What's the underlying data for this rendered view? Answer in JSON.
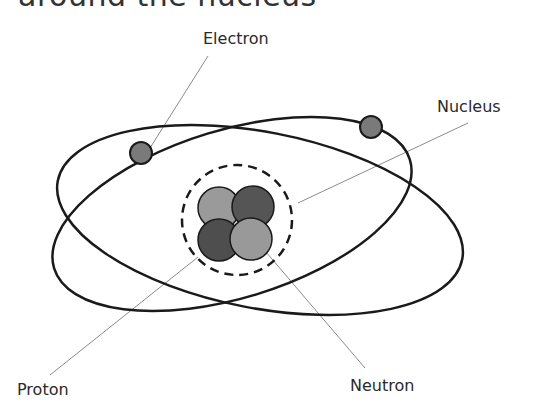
{
  "heading": {
    "text": "around the nucleus"
  },
  "labels": {
    "electron": "Electron",
    "nucleus": "Nucleus",
    "proton": "Proton",
    "neutron": "Neutron"
  },
  "colors": {
    "orbit": "#1a1a1a",
    "leader_line": "#8a8a8a",
    "electron_fill": "#7a7a7a",
    "proton_fill": "#9a9a9a",
    "neutron_fill": "#4e4e4e",
    "nucleus_boundary": "#1a1a1a",
    "text": "#2a2a2a"
  }
}
